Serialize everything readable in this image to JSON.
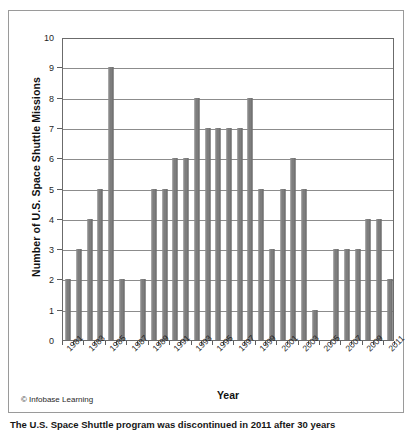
{
  "figure": {
    "credit": "© Infobase Learning",
    "caption_fragment": "The U.S. Space Shuttle program was discontinued in 2011 after 30 years"
  },
  "chart_data": {
    "type": "bar",
    "title": "",
    "xlabel": "Year",
    "ylabel": "Number of U.S. Space Shuttle Missions",
    "ylim": [
      0,
      10
    ],
    "ytick_values": [
      0,
      1,
      2,
      3,
      4,
      5,
      6,
      7,
      8,
      9,
      10
    ],
    "ytick_labels": [
      "0",
      "1",
      "2",
      "3",
      "4",
      "5",
      "6",
      "7",
      "8",
      "9",
      "10"
    ],
    "grid": true,
    "legend": "none",
    "bar_color": "#7d7d7d",
    "categories": [
      "1981",
      "1982",
      "1983",
      "1984",
      "1985",
      "1986",
      "1987",
      "1988",
      "1989",
      "1990",
      "1991",
      "1992",
      "1993",
      "1994",
      "1995",
      "1996",
      "1997",
      "1998",
      "1999",
      "2000",
      "2001",
      "2002",
      "2003",
      "2004",
      "2005",
      "2006",
      "2007",
      "2008",
      "2009",
      "2010",
      "2011"
    ],
    "values": [
      2,
      3,
      4,
      5,
      9,
      2,
      0,
      2,
      5,
      5,
      6,
      6,
      8,
      7,
      7,
      7,
      7,
      8,
      5,
      3,
      5,
      6,
      5,
      1,
      0,
      3,
      3,
      3,
      4,
      4,
      2
    ],
    "xtick_labels_shown": [
      "1981",
      "1983",
      "1985",
      "1987",
      "1989",
      "1991",
      "1993",
      "1995",
      "1997",
      "1999",
      "2001",
      "2003",
      "2005",
      "2007",
      "2009",
      "2011"
    ]
  }
}
